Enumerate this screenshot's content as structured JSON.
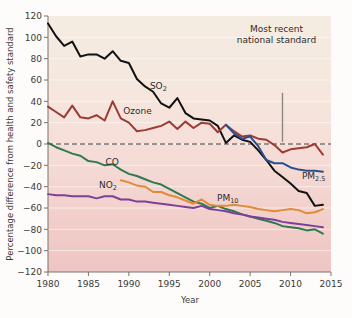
{
  "chart_data": {
    "type": "line",
    "title": "",
    "xlabel": "Year",
    "ylabel": "Percentage difference from health and safety standard",
    "xlim": [
      1980,
      2015
    ],
    "ylim": [
      -120,
      120
    ],
    "xticks": [
      "1980",
      "1985",
      "1990",
      "1995",
      "2000",
      "2005",
      "2010",
      "2015"
    ],
    "yticks": [
      "120",
      "100",
      "80",
      "60",
      "40",
      "20",
      "0",
      "−20",
      "−40",
      "−60",
      "−80",
      "−100",
      "−120"
    ],
    "grid": true,
    "legend_position": "inline-labels",
    "zero_reference_line": 0,
    "annotations": [
      {
        "name": "most-recent-national-standard",
        "text_line1": "Most recent",
        "text_line2": "national standard",
        "pointer_x": 2009,
        "pointer_y_from": 48,
        "pointer_y_to": 2
      }
    ],
    "x": [
      1980,
      1981,
      1982,
      1983,
      1984,
      1985,
      1986,
      1987,
      1988,
      1989,
      1990,
      1991,
      1992,
      1993,
      1994,
      1995,
      1996,
      1997,
      1998,
      1999,
      2000,
      2001,
      2002,
      2003,
      2004,
      2005,
      2006,
      2007,
      2008,
      2009,
      2010,
      2011,
      2012,
      2013,
      2014
    ],
    "series": [
      {
        "name": "SO2",
        "label": "SO",
        "label_sub": "2",
        "color": "#111111",
        "label_x": 1992.6,
        "label_y": 52,
        "values": [
          113,
          101,
          92,
          96,
          82,
          84,
          84,
          80,
          87,
          78,
          76,
          61,
          54,
          49,
          38,
          34,
          43,
          29,
          24,
          23,
          22,
          17,
          1,
          8,
          4,
          2,
          -6,
          -15,
          -25,
          -31,
          -37,
          -44,
          -46,
          -58,
          -57
        ]
      },
      {
        "name": "Ozone",
        "label": "Ozone",
        "label_sub": "",
        "color": "#9c3a33",
        "label_x": 1989.3,
        "label_y": 28,
        "values": [
          35,
          30,
          25,
          36,
          25,
          24,
          27,
          22,
          40,
          24,
          20,
          12,
          13,
          15,
          17,
          21,
          14,
          21,
          15,
          20,
          19,
          11,
          18,
          12,
          7,
          8,
          5,
          4,
          -1,
          -8,
          -5,
          -4,
          -3,
          0,
          -10
        ]
      },
      {
        "name": "PM2.5",
        "label": "PM",
        "label_sub": "2.5",
        "color": "#2b4f91",
        "label_x": 2011.4,
        "label_y": -33,
        "values": [
          null,
          null,
          null,
          null,
          null,
          null,
          null,
          null,
          null,
          null,
          null,
          null,
          null,
          null,
          null,
          null,
          null,
          null,
          null,
          null,
          null,
          null,
          18,
          10,
          5,
          7,
          -2,
          -15,
          -18,
          -18,
          -22,
          -24,
          -25,
          -25,
          -26
        ]
      },
      {
        "name": "CO",
        "label": "CO",
        "label_sub": "",
        "color": "#2d7a4f",
        "label_x": 1987.1,
        "label_y": -20,
        "values": [
          1,
          -3,
          -6,
          -9,
          -11,
          -16,
          -17,
          -20,
          -19,
          -24,
          -28,
          -30,
          -33,
          -36,
          -38,
          -42,
          -46,
          -50,
          -54,
          -56,
          -60,
          -58,
          -61,
          -63,
          -66,
          -68,
          -70,
          -72,
          -74,
          -77,
          -78,
          -79,
          -81,
          -80,
          -84
        ]
      },
      {
        "name": "NO2",
        "label": "NO",
        "label_sub": "2",
        "color": "#7d3f9c",
        "label_x": 1986.3,
        "label_y": -41,
        "values": [
          -47,
          -48,
          -48,
          -49,
          -49,
          -49,
          -51,
          -49,
          -49,
          -52,
          -52,
          -54,
          -54,
          -55,
          -56,
          -57,
          -58,
          -59,
          -60,
          -58,
          -61,
          -62,
          -63,
          -65,
          -66,
          -68,
          -69,
          -70,
          -71,
          -73,
          -74,
          -75,
          -76,
          -77,
          -78
        ]
      },
      {
        "name": "PM10",
        "label": "PM",
        "label_sub": "10",
        "color": "#e08b3a",
        "label_x": 2000.9,
        "label_y": -53,
        "values": [
          null,
          null,
          null,
          null,
          null,
          null,
          null,
          null,
          null,
          -34,
          -36,
          -39,
          -40,
          -45,
          -45,
          -48,
          -50,
          -53,
          -56,
          -52,
          -57,
          -58,
          -58,
          -57,
          -58,
          -59,
          -61,
          -62,
          -63,
          -62,
          -61,
          -62,
          -65,
          -64,
          -61
        ]
      }
    ]
  }
}
